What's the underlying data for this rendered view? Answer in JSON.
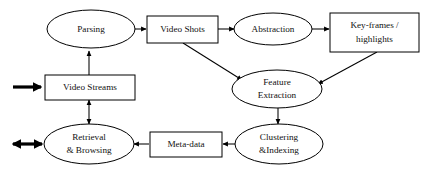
{
  "diagram": {
    "background_color": "#ffffff",
    "stroke_color": "#000000",
    "text_color": "#111111",
    "nodes": [
      {
        "id": "parsing",
        "label": "Parsing",
        "shape": "ellipse",
        "lines": [
          "Parsing"
        ]
      },
      {
        "id": "video_shots",
        "label": "Video Shots",
        "shape": "rectangle",
        "lines": [
          "Video Shots"
        ]
      },
      {
        "id": "abstraction",
        "label": "Abstraction",
        "shape": "ellipse",
        "lines": [
          "Abstraction"
        ]
      },
      {
        "id": "keyframes",
        "label": "Key-frames / highlights",
        "shape": "rectangle",
        "lines": [
          "Key-frames /",
          "highlights"
        ]
      },
      {
        "id": "video_streams",
        "label": "Video Streams",
        "shape": "rectangle",
        "lines": [
          "Video Streams"
        ]
      },
      {
        "id": "feature_extraction",
        "label": "Feature Extraction",
        "shape": "ellipse",
        "lines": [
          "Feature",
          "Extraction"
        ]
      },
      {
        "id": "retrieval_browsing",
        "label": "Retrieval & Browsing",
        "shape": "ellipse",
        "lines": [
          "Retrieval",
          "& Browsing"
        ]
      },
      {
        "id": "meta_data",
        "label": "Meta-data",
        "shape": "rectangle",
        "lines": [
          "Meta-data"
        ]
      },
      {
        "id": "clustering_indexing",
        "label": "Clustering &Indexing",
        "shape": "ellipse",
        "lines": [
          "Clustering",
          "&Indexing"
        ]
      }
    ],
    "edges": [
      {
        "id": "e-streams-to-parsing",
        "from": "video_streams",
        "to": "parsing",
        "style": "thin",
        "heads": "single"
      },
      {
        "id": "e-parsing-to-shots",
        "from": "parsing",
        "to": "video_shots",
        "style": "thin",
        "heads": "single"
      },
      {
        "id": "e-shots-to-abstraction",
        "from": "video_shots",
        "to": "abstraction",
        "style": "thin",
        "heads": "single"
      },
      {
        "id": "e-abstraction-to-keyframes",
        "from": "abstraction",
        "to": "keyframes",
        "style": "thin",
        "heads": "single"
      },
      {
        "id": "e-shots-to-feature",
        "from": "video_shots",
        "to": "feature_extraction",
        "style": "thin",
        "heads": "single"
      },
      {
        "id": "e-keyframes-to-feature",
        "from": "keyframes",
        "to": "feature_extraction",
        "style": "thin",
        "heads": "single"
      },
      {
        "id": "e-feature-to-clustering",
        "from": "feature_extraction",
        "to": "clustering_indexing",
        "style": "thin",
        "heads": "single"
      },
      {
        "id": "e-clustering-to-metadata",
        "from": "clustering_indexing",
        "to": "meta_data",
        "style": "thin",
        "heads": "single"
      },
      {
        "id": "e-metadata-to-retrieval",
        "from": "meta_data",
        "to": "retrieval_browsing",
        "style": "thin",
        "heads": "single"
      },
      {
        "id": "e-streams-retrieval",
        "from": "video_streams",
        "to": "retrieval_browsing",
        "style": "thin",
        "heads": "double"
      },
      {
        "id": "e-input-to-streams",
        "from": "external-input",
        "to": "video_streams",
        "style": "thick",
        "heads": "single"
      },
      {
        "id": "e-retrieval-external",
        "from": "retrieval_browsing",
        "to": "external-user",
        "style": "thick",
        "heads": "double"
      }
    ]
  }
}
